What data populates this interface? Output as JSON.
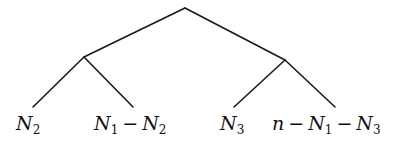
{
  "diagram": {
    "type": "binary-tree",
    "nodes": [
      {
        "id": "root",
        "kind": "internal"
      },
      {
        "id": "left",
        "kind": "internal",
        "parent": "root"
      },
      {
        "id": "right",
        "kind": "internal",
        "parent": "root"
      },
      {
        "id": "leaf1",
        "kind": "leaf",
        "parent": "left"
      },
      {
        "id": "leaf2",
        "kind": "leaf",
        "parent": "left"
      },
      {
        "id": "leaf3",
        "kind": "leaf",
        "parent": "right"
      },
      {
        "id": "leaf4",
        "kind": "leaf",
        "parent": "right"
      }
    ],
    "leaves": [
      {
        "id": "leaf1",
        "label_text": "N2",
        "parts": [
          {
            "t": "N",
            "sub": "2"
          }
        ]
      },
      {
        "id": "leaf2",
        "label_text": "N1 − N2",
        "parts": [
          {
            "t": "N",
            "sub": "1"
          },
          {
            "op": "−"
          },
          {
            "t": "N",
            "sub": "2"
          }
        ]
      },
      {
        "id": "leaf3",
        "label_text": "N3",
        "parts": [
          {
            "t": "N",
            "sub": "3"
          }
        ]
      },
      {
        "id": "leaf4",
        "label_text": "n − N1 − N3",
        "parts": [
          {
            "t": "n"
          },
          {
            "op": "−"
          },
          {
            "t": "N",
            "sub": "1"
          },
          {
            "op": "−"
          },
          {
            "t": "N",
            "sub": "3"
          }
        ]
      }
    ]
  }
}
